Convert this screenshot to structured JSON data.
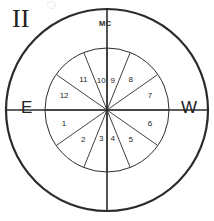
{
  "chart": {
    "title_glyph": "II",
    "glyph_name": "gemini-roman-numeral-two",
    "labels": {
      "mc": "MC",
      "east": "E",
      "west": "W"
    },
    "geometry": {
      "center_x": 107,
      "center_y": 110,
      "outer_radius": 101,
      "inner_radius": 62,
      "stroke_color": "#2b2b2b",
      "outer_stroke_width": 2.2,
      "inner_stroke_width": 1.0,
      "spoke_stroke_width": 0.9,
      "axis_stroke_width": 1.6
    },
    "axes": [
      {
        "name": "mc-ic-axis",
        "angle_deg": 90
      },
      {
        "name": "asc-dsc-axis",
        "angle_deg": 0
      }
    ],
    "cusp_angles_deg": [
      180,
      215,
      248,
      270,
      292,
      325,
      0,
      35,
      68,
      90,
      112,
      145
    ],
    "houses": [
      {
        "number": "1",
        "angle_deg": 197.5,
        "radius": 45
      },
      {
        "number": "2",
        "angle_deg": 231.5,
        "radius": 38
      },
      {
        "number": "3",
        "angle_deg": 259.0,
        "radius": 30
      },
      {
        "number": "4",
        "angle_deg": 281.0,
        "radius": 30
      },
      {
        "number": "5",
        "angle_deg": 308.5,
        "radius": 38
      },
      {
        "number": "6",
        "angle_deg": 342.5,
        "radius": 45
      },
      {
        "number": "7",
        "angle_deg": 17.5,
        "radius": 45
      },
      {
        "number": "8",
        "angle_deg": 51.5,
        "radius": 38
      },
      {
        "number": "9",
        "angle_deg": 79.0,
        "radius": 30
      },
      {
        "number": "10",
        "angle_deg": 101.0,
        "radius": 30
      },
      {
        "number": "11",
        "angle_deg": 128.5,
        "radius": 38
      },
      {
        "number": "12",
        "angle_deg": 162.5,
        "radius": 45
      }
    ]
  }
}
